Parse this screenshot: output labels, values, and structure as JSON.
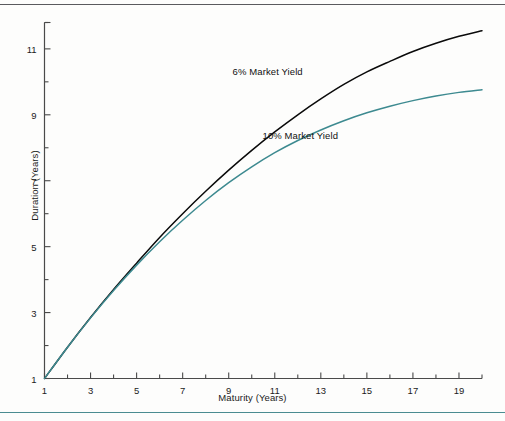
{
  "chart_data": {
    "type": "line",
    "title": "",
    "xlabel": "Maturity (Years)",
    "ylabel": "Duration (Years)",
    "xlim": [
      1,
      20
    ],
    "ylim": [
      1,
      11.8
    ],
    "xticks": [
      1,
      3,
      5,
      7,
      9,
      11,
      13,
      15,
      17,
      19
    ],
    "xtick_labels": [
      "1",
      "3",
      "5",
      "7",
      "9",
      "11",
      "13",
      "15",
      "17",
      "19"
    ],
    "xminor_ticks": [
      2,
      4,
      6,
      8,
      10,
      12,
      14,
      16,
      18,
      20
    ],
    "yticks": [
      1,
      3,
      5,
      7,
      9,
      11
    ],
    "ytick_labels": [
      "1",
      "3",
      "5",
      "7",
      "9",
      "11"
    ],
    "yminor_ticks": [
      2,
      4,
      6,
      8,
      10,
      11.8
    ],
    "grid": false,
    "legend_position": "inline-annotation",
    "series": [
      {
        "name": "6% Market Yield",
        "color": "#0a0a0a",
        "label_x": 11.6,
        "label_y": 10.3,
        "x": [
          1,
          2,
          3,
          4,
          5,
          6,
          7,
          8,
          9,
          10,
          11,
          12,
          13,
          14,
          15,
          16,
          17,
          18,
          19,
          20
        ],
        "values": [
          1.0,
          1.95,
          2.85,
          3.7,
          4.5,
          5.28,
          6.0,
          6.68,
          7.32,
          7.92,
          8.48,
          9.0,
          9.48,
          9.92,
          10.3,
          10.62,
          10.92,
          11.17,
          11.38,
          11.55
        ]
      },
      {
        "name": "10% Market Yield",
        "color": "#3d8a90",
        "label_x": 12.9,
        "label_y": 8.35,
        "x": [
          1,
          2,
          3,
          4,
          5,
          6,
          7,
          8,
          9,
          10,
          11,
          12,
          13,
          14,
          15,
          16,
          17,
          18,
          19,
          20
        ],
        "values": [
          1.0,
          1.95,
          2.84,
          3.67,
          4.44,
          5.15,
          5.8,
          6.4,
          6.94,
          7.42,
          7.85,
          8.22,
          8.54,
          8.82,
          9.06,
          9.26,
          9.43,
          9.57,
          9.68,
          9.76
        ]
      }
    ]
  },
  "axes": {
    "x_axis_label": "Maturity (Years)",
    "y_axis_label": "Duration (Years)"
  },
  "annotations": {
    "series_a_label": "6% Market Yield",
    "series_b_label": "10% Market Yield"
  },
  "colors": {
    "series_a": "#0a0a0a",
    "series_b": "#3d8a90",
    "axis": "#4a4a4a",
    "rule_top": "#5a5a5e",
    "rule_bottom": "#4a8c91",
    "background": "#fdfdfc"
  }
}
